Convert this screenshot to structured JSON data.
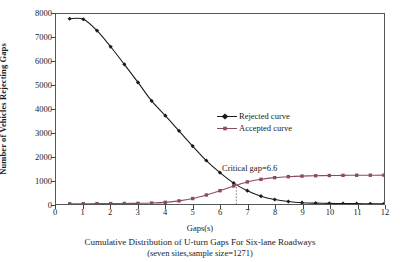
{
  "chart_data": {
    "type": "line",
    "title": "",
    "xlabel": "Gaps(s)",
    "ylabel": "Number of Vehicles Rejecting Gaps",
    "xlim": [
      0,
      12
    ],
    "ylim": [
      0,
      8000
    ],
    "xticks": [
      0,
      1,
      2,
      3,
      4,
      5,
      6,
      7,
      8,
      9,
      10,
      11,
      12
    ],
    "yticks": [
      0,
      1000,
      2000,
      3000,
      4000,
      5000,
      6000,
      7000,
      8000
    ],
    "grid": false,
    "legend_position": "center-right",
    "x": [
      0.5,
      1,
      1.5,
      2,
      2.5,
      3,
      3.5,
      4,
      4.5,
      5,
      5.5,
      6,
      6.5,
      7,
      7.5,
      8,
      8.5,
      9,
      9.5,
      10,
      10.5,
      11,
      11.5,
      12
    ],
    "series": [
      {
        "name": "Rejected curve",
        "color": "#1a1a1a",
        "marker": "diamond",
        "values": [
          7800,
          7780,
          7300,
          6620,
          5880,
          5120,
          4340,
          3720,
          3080,
          2440,
          1830,
          1320,
          880,
          560,
          330,
          190,
          105,
          55,
          35,
          25,
          20,
          15,
          12,
          10
        ]
      },
      {
        "name": "Accepted curve",
        "color": "#8c4a5e",
        "marker": "square",
        "values": [
          10,
          12,
          15,
          18,
          22,
          28,
          40,
          70,
          130,
          230,
          380,
          560,
          760,
          930,
          1040,
          1110,
          1150,
          1175,
          1190,
          1200,
          1205,
          1210,
          1212,
          1215
        ]
      }
    ],
    "annotations": [
      {
        "name": "critical-gap",
        "label": "Critical gap=6.6",
        "x": 6.6,
        "y": 850,
        "marker_line": "dotted-vertical"
      }
    ]
  },
  "axes": {
    "y_title": "Number of Vehicles Rejecting Gaps",
    "x_title": "Gaps(s)",
    "y_tick_labels": [
      "8000",
      "7000",
      "6000",
      "5000",
      "4000",
      "3000",
      "2000",
      "1000",
      "0"
    ],
    "x_tick_labels": [
      "0",
      "1",
      "2",
      "3",
      "4",
      "5",
      "6",
      "7",
      "8",
      "9",
      "10",
      "11",
      "12"
    ]
  },
  "legend": {
    "items": [
      {
        "label": "Rejected curve",
        "color": "#1a1a1a"
      },
      {
        "label": "Accepted curve",
        "color": "#8c4a5e"
      }
    ]
  },
  "annotation": {
    "critical_gap_label": "Critical gap=6.6"
  },
  "caption": {
    "line1": "Cumulative Distribution of U-turn Gaps For Six-lane Roadways",
    "line2": "(seven sites,sample size=1271)"
  },
  "colors": {
    "rejected": "#1a1a1a",
    "accepted": "#8c4a5e",
    "axis": "#555555",
    "background": "#ffffff"
  }
}
